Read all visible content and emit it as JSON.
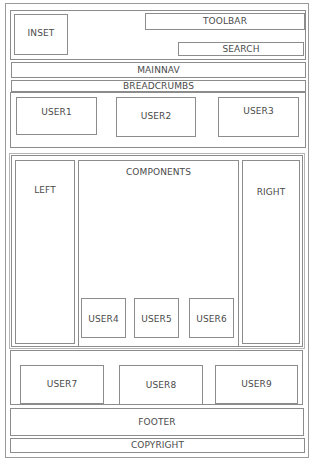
{
  "wireframe": {
    "header": {
      "inset": "INSET",
      "toolbar": "TOOLBAR",
      "search": "SEARCH"
    },
    "mainnav": "MAINNAV",
    "breadcrumbs": "BREADCRUMBS",
    "top_users": [
      "USER1",
      "USER2",
      "USER3"
    ],
    "main": {
      "left": "LEFT",
      "components": "COMPONENTS",
      "right": "RIGHT",
      "component_users": [
        "USER4",
        "USER5",
        "USER6"
      ]
    },
    "bottom_users": [
      "USER7",
      "USER8",
      "USER9"
    ],
    "footer": "FOOTER",
    "copyright": "COPYRIGHT"
  },
  "colors": {
    "border": "#8c8c8c",
    "text": "#4a4a4a",
    "background": "#ffffff"
  }
}
